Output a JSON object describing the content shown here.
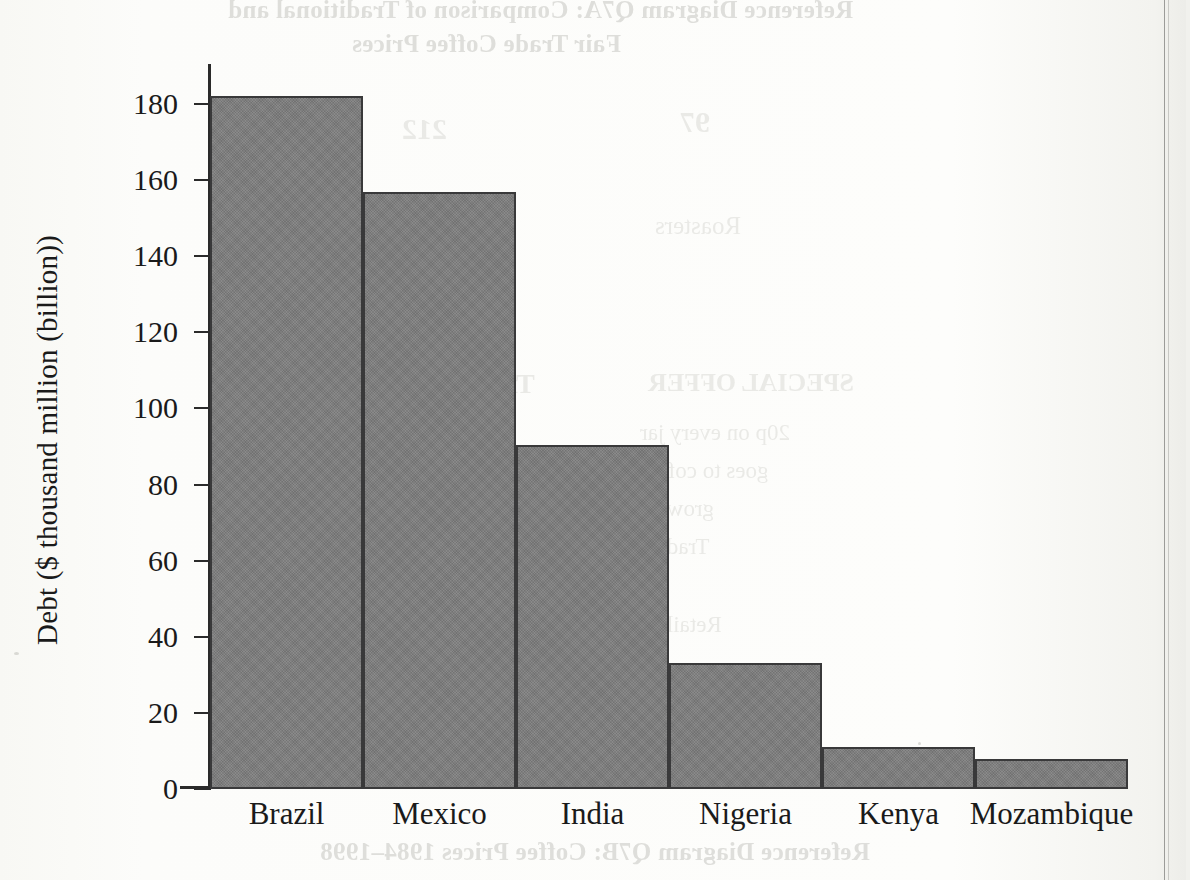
{
  "page": {
    "bleed_through_top_line1": "Reference Diagram Q7A: Comparison of Traditional and",
    "bleed_through_top_line2": "Fair Trade Coffee Prices",
    "bleed_through_bottom": "Reference Diagram Q7B: Coffee Prices 1984–1998",
    "ghost_fragments": [
      "97",
      "212",
      "Roasters",
      "SPECIAL OFFER",
      "20p on every jar",
      "goes to coffee",
      "growers",
      "Traders",
      "Traditional",
      "Retailers"
    ],
    "edge_line_color": "#8d8d8a"
  },
  "chart_data": {
    "type": "bar",
    "title": "",
    "xlabel": "",
    "ylabel": "Debt ($ thousand million (billion))",
    "categories": [
      "Brazil",
      "Mexico",
      "India",
      "Nigeria",
      "Kenya",
      "Mozambique"
    ],
    "values": [
      182,
      157,
      90.5,
      33,
      11,
      8
    ],
    "ylim": [
      0,
      190
    ],
    "ytick_values": [
      0,
      20,
      40,
      60,
      80,
      100,
      120,
      140,
      160,
      180
    ],
    "ytick_labels": [
      "0",
      "20",
      "40",
      "60",
      "80",
      "100",
      "120",
      "140",
      "160",
      "180"
    ],
    "grid": false,
    "legend": null,
    "bar_fill_color": "#7c7c7c",
    "bar_edge_color": "#39393a",
    "axis_color": "#2a2a2a",
    "bar_gap": 0
  }
}
